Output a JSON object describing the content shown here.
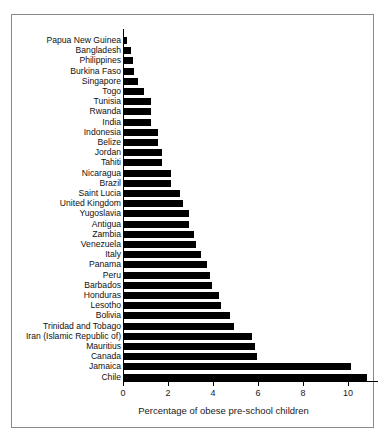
{
  "chart_data": {
    "type": "bar",
    "orientation": "horizontal",
    "title": "",
    "xlabel": "Percentage of obese pre-school children",
    "ylabel": "",
    "xlim": [
      0,
      10.9
    ],
    "xticks": [
      0,
      2,
      4,
      6,
      8,
      10
    ],
    "xtick_labels": [
      "0",
      "2",
      "4",
      "6",
      "8",
      "10"
    ],
    "grid": false,
    "legend": false,
    "categories": [
      "Papua New Guinea",
      "Bangladesh",
      "Philippines",
      "Burkina Faso",
      "Singapore",
      "Togo",
      "Tunisia",
      "Rwanda",
      "India",
      "Indonesia",
      "Belize",
      "Jordan",
      "Tahiti",
      "Nicaragua",
      "Brazil",
      "Saint Lucia",
      "United Kingdom",
      "Yugoslavia",
      "Antigua",
      "Zambia",
      "Venezuela",
      "Italy",
      "Panama",
      "Peru",
      "Barbados",
      "Honduras",
      "Lesotho",
      "Bolivia",
      "Trinidad and Tobago",
      "Iran (Islamic Republic of)",
      "Mauritius",
      "Canada",
      "Jamaica",
      "Chile"
    ],
    "values": [
      0.15,
      0.3,
      0.4,
      0.45,
      0.6,
      0.9,
      1.2,
      1.2,
      1.2,
      1.5,
      1.5,
      1.7,
      1.7,
      2.1,
      2.1,
      2.5,
      2.6,
      2.9,
      2.9,
      3.1,
      3.2,
      3.4,
      3.7,
      3.8,
      3.9,
      4.2,
      4.3,
      4.7,
      4.9,
      5.7,
      5.8,
      5.9,
      10.1,
      10.8
    ],
    "bar_color": "#000000"
  },
  "axis": {
    "x_title": "Percentage of obese pre-school children"
  }
}
